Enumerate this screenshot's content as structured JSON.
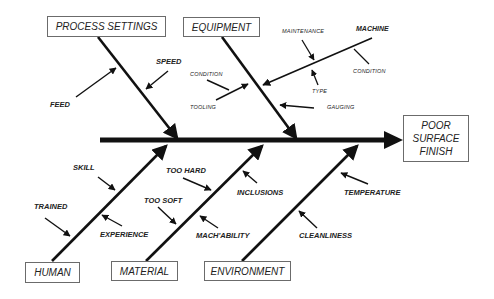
{
  "diagram": {
    "type": "fishbone",
    "effect": {
      "lines": [
        "POOR",
        "SURFACE",
        "FINISH"
      ]
    },
    "categories": {
      "process_settings": {
        "label": "PROCESS SETTINGS",
        "causes": [
          "FEED",
          "SPEED"
        ]
      },
      "equipment": {
        "label": "EQUIPMENT",
        "causes": [
          "CONDITION",
          "TOOLING",
          "GAUGING"
        ],
        "sub_branch": {
          "label": "MACHINE",
          "causes": [
            "MAINTENANCE",
            "TYPE",
            "CONDITION"
          ]
        }
      },
      "human": {
        "label": "HUMAN",
        "causes": [
          "SKILL",
          "TRAINED",
          "EXPERIENCE"
        ]
      },
      "material": {
        "label": "MATERIAL",
        "causes": [
          "TOO HARD",
          "TOO SOFT",
          "MACH'ABILITY",
          "INCLUSIONS"
        ]
      },
      "environment": {
        "label": "ENVIRONMENT",
        "causes": [
          "TEMPERATURE",
          "CLEANLINESS"
        ]
      }
    },
    "colors": {
      "line": "#111111",
      "box_border": "#6b6b6b",
      "text": "#222222"
    }
  }
}
